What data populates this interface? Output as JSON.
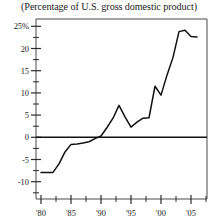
{
  "chart_title": "(Percentage of U.S. gross domestic product)",
  "axes": {
    "y_tick_labels": [
      "25%",
      "20",
      "15",
      "10",
      "5",
      "0",
      "-5",
      "-10"
    ],
    "x_tick_labels": [
      "'80",
      "'85",
      "'90",
      "'95",
      "'00",
      "'05"
    ]
  },
  "colors": {
    "line": "#111111",
    "frame": "#4a4a4a",
    "text": "#1b1b1b",
    "background": "#ffffff"
  },
  "chart_data": {
    "type": "line",
    "title": "(Percentage of U.S. gross domestic product)",
    "xlabel": "",
    "ylabel": "",
    "xlim": [
      1979,
      2006.5
    ],
    "ylim": [
      -12,
      26.5
    ],
    "yticks": [
      25,
      20,
      15,
      10,
      5,
      0,
      -5,
      -10
    ],
    "ytick_labels": [
      "25%",
      "20",
      "15",
      "10",
      "5",
      "0",
      "-5",
      "-10"
    ],
    "xticks": [
      1980,
      1985,
      1990,
      1995,
      2000,
      2005
    ],
    "xtick_labels": [
      "'80",
      "'85",
      "'90",
      "'95",
      "'00",
      "'05"
    ],
    "xticks_minor": [
      1982.5,
      1987.5,
      1992.5,
      1997.5,
      2002.5
    ],
    "grid": false,
    "legend": false,
    "zero_line": true,
    "series": [
      {
        "name": "Net international investment position",
        "x": [
          1980,
          1981,
          1982,
          1983,
          1984,
          1985,
          1986,
          1987,
          1988,
          1989,
          1990,
          1991,
          1992,
          1993,
          1994,
          1995,
          1996,
          1997,
          1998,
          1999,
          2000,
          2001,
          2002,
          2003,
          2004,
          2005,
          2006
        ],
        "values": [
          -7.9,
          -7.9,
          -7.9,
          -6.0,
          -3.3,
          -1.6,
          -1.5,
          -1.3,
          -1.0,
          -0.3,
          0.3,
          2.2,
          4.3,
          7.2,
          4.6,
          2.3,
          3.4,
          4.3,
          4.4,
          11.5,
          9.5,
          14.0,
          18.0,
          23.8,
          24.1,
          22.7,
          22.6
        ]
      }
    ]
  }
}
